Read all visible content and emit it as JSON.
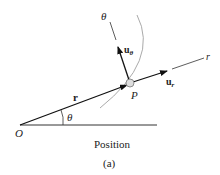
{
  "diagram": {
    "origin_label": "O",
    "position_vector_label": "r",
    "angle_label": "θ",
    "point_label": "P",
    "radial_axis_label": "r",
    "transverse_axis_label": "θ",
    "unit_radial_label": "u",
    "unit_radial_sub": "r",
    "unit_transverse_label": "u",
    "unit_transverse_sub": "θ",
    "caption": "Position",
    "subcaption": "(a)"
  }
}
